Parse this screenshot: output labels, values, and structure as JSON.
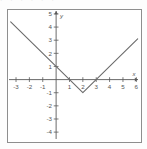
{
  "figure": {
    "ghost_text": "·  ·  ·        ·  ·          ·",
    "axis_label_x": "x",
    "axis_label_y": "y"
  },
  "chart_data": {
    "type": "line",
    "title": "",
    "subtitle": "",
    "xlabel": "x",
    "ylabel": "y",
    "xlim": [
      -3.6,
      6.2
    ],
    "ylim": [
      -4.6,
      5.3
    ],
    "grid": false,
    "legend": null,
    "xticks": [
      -3,
      -2,
      -1,
      1,
      2,
      3,
      4,
      5,
      6
    ],
    "xticklabels": [
      "-3",
      "-2",
      "-1",
      "1",
      "2",
      "3",
      "4",
      "5",
      "6"
    ],
    "yticks": [
      -4,
      -3,
      -2,
      -1,
      1,
      2,
      3,
      4,
      5
    ],
    "yticklabels": [
      "-4",
      "-3",
      "-2",
      "-1",
      "1",
      "2",
      "3",
      "4",
      "5"
    ],
    "series": [
      {
        "name": "y = |x - 2| - 1",
        "style": "solid",
        "color": "#6b6b6b",
        "x": [
          -3.4,
          2.0,
          6.1
        ],
        "y": [
          4.4,
          -1.0,
          3.1
        ],
        "vertex": [
          2.0,
          -1.0
        ],
        "x_intercepts": [
          1.0,
          3.0
        ],
        "y_intercept": 1.0
      }
    ],
    "annotations": []
  }
}
